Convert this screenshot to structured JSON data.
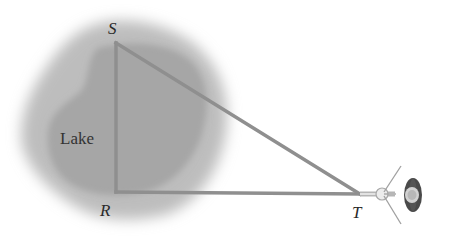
{
  "figure": {
    "labels": {
      "S": "S",
      "R": "R",
      "T": "T",
      "lake": "Lake"
    },
    "vertices": {
      "S": [
        116,
        43
      ],
      "R": [
        116,
        192
      ],
      "T": [
        360,
        194
      ]
    },
    "colors": {
      "triangle_line": "#8f8f8f",
      "lake_outer": "#b8b8b8",
      "lake_inner": "#a3a3a3",
      "text": "#2a2a2a"
    }
  }
}
